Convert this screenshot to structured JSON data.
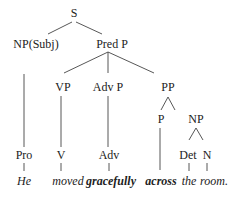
{
  "nodes": {
    "s": "S",
    "np_subj": "NP(Subj)",
    "pred_p": "Pred P",
    "vp": "VP",
    "adv_p": "Adv P",
    "pp": "PP",
    "p": "P",
    "np": "NP",
    "pro": "Pro",
    "v": "V",
    "adv": "Adv",
    "det": "Det",
    "n": "N"
  },
  "words": {
    "he": "He",
    "moved": "moved",
    "gracefully": "gracefully",
    "across": "across",
    "the": "the",
    "room": "room."
  }
}
